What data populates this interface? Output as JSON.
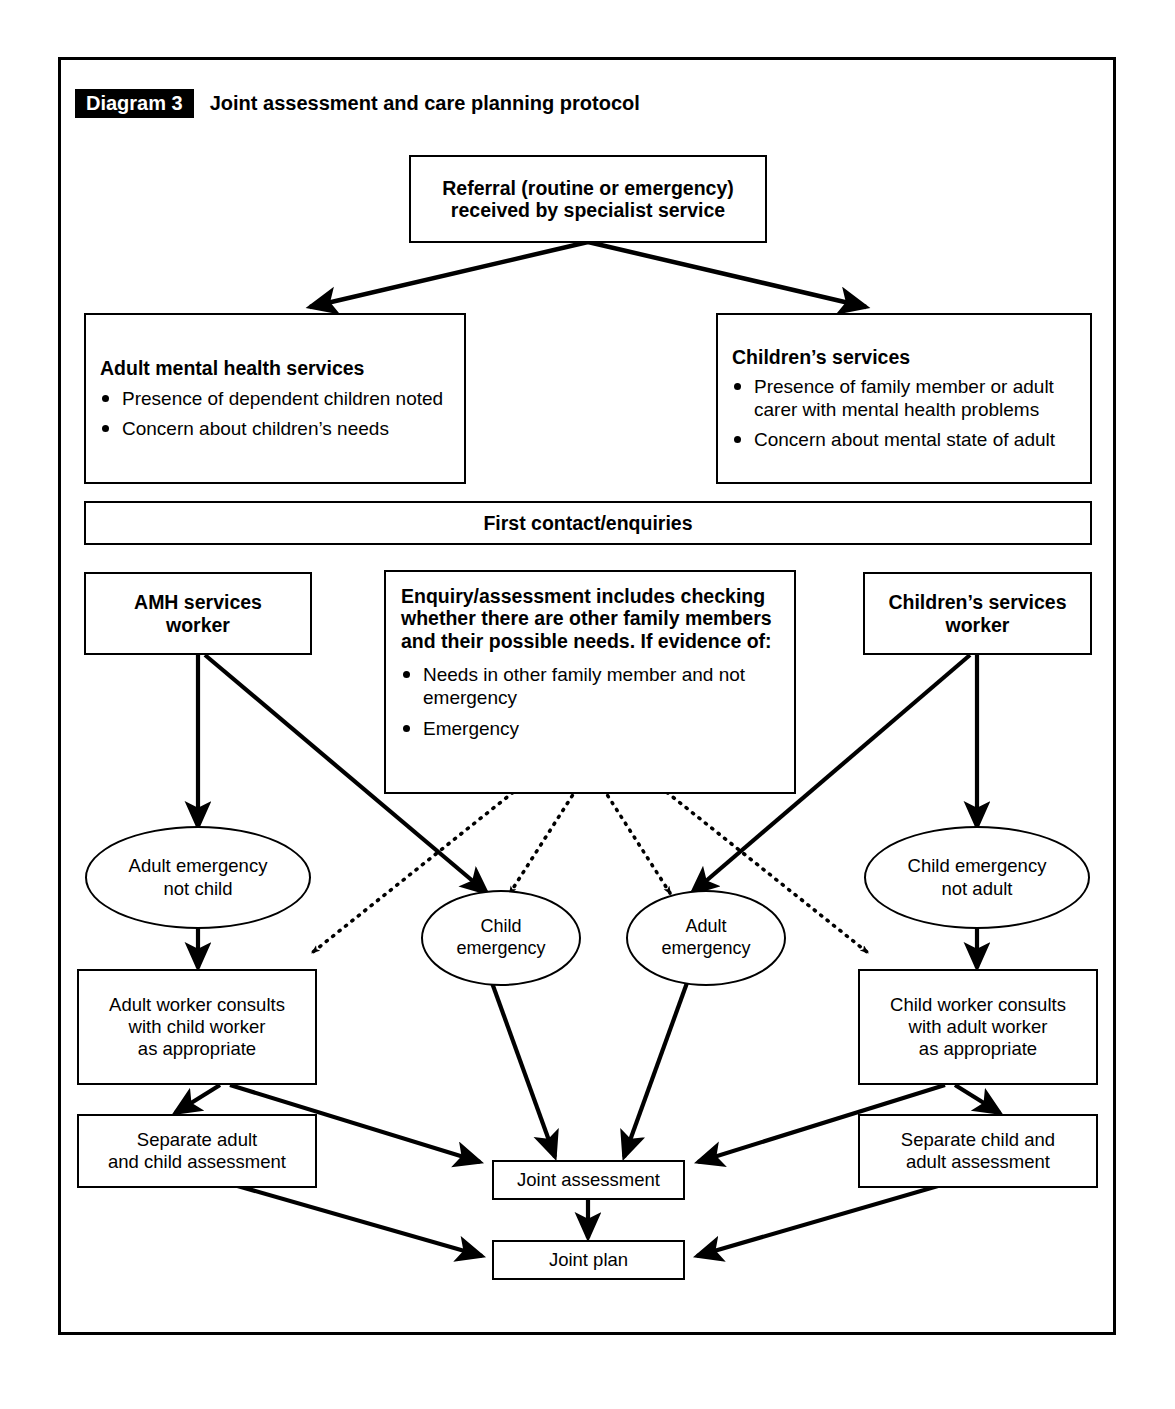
{
  "header": {
    "tag": "Diagram 3",
    "title": "Joint assessment and care planning protocol"
  },
  "nodes": {
    "referral": "Referral (routine or emergency)\nreceived by specialist service",
    "referral_line1": "Referral (routine or emergency)",
    "referral_line2": "received by specialist service",
    "amh_services": {
      "title": "Adult mental health services",
      "bullets": [
        "Presence of dependent children noted",
        "Concern about children’s needs"
      ]
    },
    "childrens_services": {
      "title": "Children’s services",
      "bullets": [
        "Presence of family member or adult carer with mental health problems",
        "Concern about mental state of adult"
      ]
    },
    "first_contact": "First contact/enquiries",
    "amh_worker_line1": "AMH services",
    "amh_worker_line2": "worker",
    "childrens_worker_line1": "Children’s services",
    "childrens_worker_line2": "worker",
    "enquiry": {
      "title": "Enquiry/assessment includes checking whether there are other family members and their possible needs. If evidence of:",
      "bullets": [
        "Needs in other family member and not emergency",
        "Emergency"
      ]
    },
    "adult_emergency_not_child": "Adult emergency\nnot child",
    "child_emergency": "Child\nemergency",
    "adult_emergency": "Adult\nemergency",
    "child_emergency_not_adult": "Child emergency\nnot adult",
    "adult_worker_consults": "Adult worker consults\nwith child worker\nas appropriate",
    "child_worker_consults": "Child worker consults\nwith adult worker\nas appropriate",
    "separate_adult_child": "Separate adult\nand child assessment",
    "separate_child_adult": "Separate child and\nadult assessment",
    "joint_assessment": "Joint assessment",
    "joint_plan": "Joint plan"
  },
  "colors": {
    "ink": "#000000",
    "paper": "#ffffff",
    "tag_background": "#000000",
    "tag_text": "#ffffff"
  }
}
